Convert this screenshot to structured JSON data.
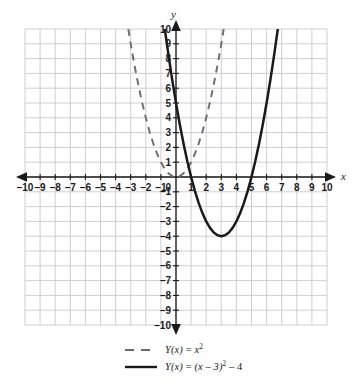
{
  "axes": {
    "x_label": "x",
    "y_label": "y",
    "x_ticks": [
      "-10",
      "-9",
      "-8",
      "-7",
      "-6",
      "-5",
      "-4",
      "-3",
      "-2",
      "-1",
      "0",
      "1",
      "2",
      "3",
      "4",
      "5",
      "6",
      "7",
      "8",
      "9",
      "10"
    ],
    "y_ticks": [
      "10",
      "9",
      "8",
      "7",
      "6",
      "5",
      "4",
      "3",
      "2",
      "1",
      "-1",
      "-2",
      "-3",
      "-4",
      "-5",
      "-6",
      "-7",
      "-8",
      "-9",
      "-10"
    ],
    "origin_label": "0"
  },
  "legend": {
    "items": [
      {
        "style": "dashed",
        "prefix": "Y",
        "arg": "(x)",
        "equals": " = ",
        "body": "x",
        "exponent": "2",
        "suffix": ""
      },
      {
        "style": "solid",
        "prefix": "Y",
        "arg": "(x)",
        "equals": " = ",
        "body": "(x – 3)",
        "exponent": "2",
        "suffix": " – 4"
      }
    ]
  },
  "colors": {
    "grid_major": "#c9c9cf",
    "grid_minor": "#e4e4e8",
    "axis": "#1a1a1a",
    "curve_solid": "#1a1a1a",
    "curve_dashed": "#6b6b70",
    "background": "#ffffff"
  },
  "chart_data": {
    "type": "line",
    "title": "",
    "xlabel": "x",
    "ylabel": "y",
    "xlim": [
      -10,
      10
    ],
    "ylim": [
      -10,
      10
    ],
    "grid": true,
    "legend_position": "bottom",
    "series": [
      {
        "name": "Y(x) = x^2",
        "style": "dashed",
        "color": "#6b6b70",
        "vertex": [
          0,
          0
        ],
        "roots": [
          0
        ],
        "x": [
          -3.162,
          -3.0,
          -2.75,
          -2.5,
          -2.25,
          -2.0,
          -1.75,
          -1.5,
          -1.25,
          -1.0,
          -0.75,
          -0.5,
          -0.25,
          0,
          0.25,
          0.5,
          0.75,
          1.0,
          1.25,
          1.5,
          1.75,
          2.0,
          2.25,
          2.5,
          2.75,
          3.0,
          3.162
        ],
        "y": [
          10.0,
          9.0,
          7.5625,
          6.25,
          5.0625,
          4.0,
          3.0625,
          2.25,
          1.5625,
          1.0,
          0.5625,
          0.25,
          0.0625,
          0,
          0.0625,
          0.25,
          0.5625,
          1.0,
          1.5625,
          2.25,
          3.0625,
          4.0,
          5.0625,
          6.25,
          7.5625,
          9.0,
          10.0
        ]
      },
      {
        "name": "Y(x) = (x - 3)^2 - 4",
        "style": "solid",
        "color": "#1a1a1a",
        "vertex": [
          3,
          -4
        ],
        "roots": [
          1,
          5
        ],
        "x": [
          -0.742,
          -0.5,
          -0.25,
          0,
          0.25,
          0.5,
          0.75,
          1.0,
          1.25,
          1.5,
          1.75,
          2.0,
          2.25,
          2.5,
          2.75,
          3.0,
          3.25,
          3.5,
          3.75,
          4.0,
          4.25,
          4.5,
          4.75,
          5.0,
          5.25,
          5.5,
          5.75,
          6.0,
          6.25,
          6.5,
          6.742
        ],
        "y": [
          10.0,
          8.25,
          6.5625,
          5.0,
          3.5625,
          2.25,
          1.0625,
          0,
          -0.9375,
          -1.75,
          -2.4375,
          -3.0,
          -3.4375,
          -3.75,
          -3.9375,
          -4.0,
          -3.9375,
          -3.75,
          -3.4375,
          -3.0,
          -2.4375,
          -1.75,
          -0.9375,
          0,
          1.0625,
          2.25,
          3.5625,
          5.0,
          6.5625,
          8.25,
          10.0
        ]
      }
    ]
  }
}
